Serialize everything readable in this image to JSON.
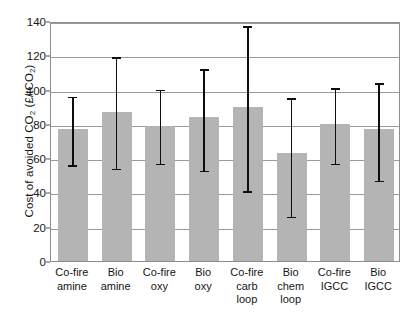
{
  "chart_data": {
    "type": "bar",
    "title": "",
    "xlabel": "",
    "ylabel": "Cost of avoided CO2 (£/tCO2)",
    "ylabel_parts": {
      "prefix": "Cost of avoided CO",
      "sub1": "2",
      "mid": " (£/tCO",
      "sub2": "2",
      "suffix": ")"
    },
    "ylim": [
      0,
      140
    ],
    "ytick_labels": [
      "140",
      "120",
      "100",
      "80",
      "60",
      "40",
      "20",
      "0"
    ],
    "ytick_values": [
      140,
      120,
      100,
      80,
      60,
      40,
      20,
      0
    ],
    "grid": true,
    "legend": null,
    "categories": [
      "Co-fire amine",
      "Bio amine",
      "Co-fire oxy",
      "Bio oxy",
      "Co-fire carb loop",
      "Bio chem loop",
      "Co-fire IGCC",
      "Bio IGCC"
    ],
    "category_label_lines": [
      [
        "Co-fire",
        "amine"
      ],
      [
        "Bio",
        "amine"
      ],
      [
        "Co-fire",
        "oxy"
      ],
      [
        "Bio",
        "oxy"
      ],
      [
        "Co-fire",
        "carb",
        "loop"
      ],
      [
        "Bio",
        "chem",
        "loop"
      ],
      [
        "Co-fire",
        "IGCC"
      ],
      [
        "Bio",
        "IGCC"
      ]
    ],
    "values": [
      77,
      87,
      79,
      84,
      90,
      63,
      80,
      77
    ],
    "error_low": [
      56,
      54,
      57,
      53,
      41,
      26,
      57,
      47
    ],
    "error_high": [
      97,
      120,
      101,
      113,
      138,
      96,
      102,
      105
    ],
    "bar_color": "#b4b4b4",
    "error_color": "#0d0d0d",
    "grid_color": "#9a9a9a",
    "frame_color": "#8c8c8c",
    "background": "#ffffff"
  }
}
